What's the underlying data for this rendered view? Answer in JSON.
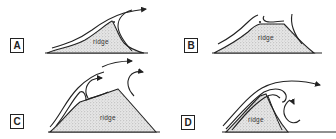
{
  "diagram": {
    "type": "airflow-over-ridge",
    "panels": [
      {
        "id": "A",
        "label": "A",
        "ridge_label": "ridge"
      },
      {
        "id": "B",
        "label": "B",
        "ridge_label": "ridge"
      },
      {
        "id": "C",
        "label": "C",
        "ridge_label": "ridge"
      },
      {
        "id": "D",
        "label": "D",
        "ridge_label": "ridge"
      }
    ],
    "colors": {
      "line": "#222222",
      "ridge_fill": "#d8d8d8",
      "background": "#ffffff"
    }
  }
}
